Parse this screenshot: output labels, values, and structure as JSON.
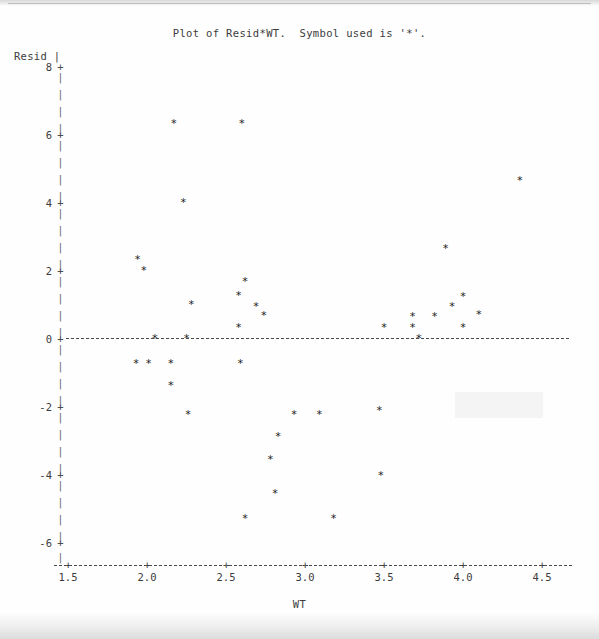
{
  "title": "Plot of Resid*WT.  Symbol used is '*'.",
  "symbol": "*",
  "axes": {
    "y_name": "Resid |",
    "x_name": "WT",
    "y_ticks": [
      "8",
      "6",
      "4",
      "2",
      "0",
      "-2",
      "-4",
      "-6"
    ],
    "x_ticks": [
      "1.5",
      "2.0",
      "2.5",
      "3.0",
      "3.5",
      "4.0",
      "4.5"
    ],
    "tick_symbol": "+",
    "vertical_bar": "|"
  },
  "chart_data": {
    "type": "scatter",
    "title": "Plot of Resid*WT.  Symbol used is '*'.",
    "xlabel": "WT",
    "ylabel": "Resid",
    "xlim": [
      1.38,
      4.57
    ],
    "ylim": [
      -6.6,
      8.3
    ],
    "xticks": [
      1.5,
      2.0,
      2.5,
      3.0,
      3.5,
      4.0,
      4.5
    ],
    "yticks": [
      8,
      6,
      4,
      2,
      0,
      -2,
      -4,
      -6
    ],
    "grid": false,
    "legend": "none",
    "marker": "*",
    "reference_lines": [
      {
        "axis": "y",
        "value": 0,
        "style": "dashed"
      }
    ],
    "points": [
      {
        "x": 2.17,
        "y": 6.32
      },
      {
        "x": 2.6,
        "y": 6.32
      },
      {
        "x": 4.36,
        "y": 4.62
      },
      {
        "x": 2.23,
        "y": 4.0
      },
      {
        "x": 3.89,
        "y": 2.62
      },
      {
        "x": 1.94,
        "y": 2.32
      },
      {
        "x": 1.98,
        "y": 2.0
      },
      {
        "x": 2.62,
        "y": 1.65
      },
      {
        "x": 2.58,
        "y": 1.26
      },
      {
        "x": 4.0,
        "y": 1.23
      },
      {
        "x": 2.28,
        "y": 1.0
      },
      {
        "x": 2.69,
        "y": 0.94
      },
      {
        "x": 3.93,
        "y": 0.94
      },
      {
        "x": 2.74,
        "y": 0.65
      },
      {
        "x": 4.1,
        "y": 0.68
      },
      {
        "x": 3.68,
        "y": 0.62
      },
      {
        "x": 3.82,
        "y": 0.62
      },
      {
        "x": 2.58,
        "y": 0.32
      },
      {
        "x": 3.5,
        "y": 0.32
      },
      {
        "x": 3.68,
        "y": 0.32
      },
      {
        "x": 4.0,
        "y": 0.32
      },
      {
        "x": 2.05,
        "y": 0.0
      },
      {
        "x": 2.25,
        "y": 0.0
      },
      {
        "x": 3.72,
        "y": 0.0
      },
      {
        "x": 1.93,
        "y": -0.76
      },
      {
        "x": 2.01,
        "y": -0.76
      },
      {
        "x": 2.15,
        "y": -0.76
      },
      {
        "x": 2.59,
        "y": -0.74
      },
      {
        "x": 2.15,
        "y": -1.41
      },
      {
        "x": 2.26,
        "y": -2.26
      },
      {
        "x": 2.93,
        "y": -2.26
      },
      {
        "x": 3.09,
        "y": -2.26
      },
      {
        "x": 3.47,
        "y": -2.12
      },
      {
        "x": 2.83,
        "y": -2.91
      },
      {
        "x": 2.78,
        "y": -3.56
      },
      {
        "x": 3.48,
        "y": -4.03
      },
      {
        "x": 2.81,
        "y": -4.56
      },
      {
        "x": 2.62,
        "y": -5.32
      },
      {
        "x": 3.18,
        "y": -5.32
      }
    ]
  }
}
